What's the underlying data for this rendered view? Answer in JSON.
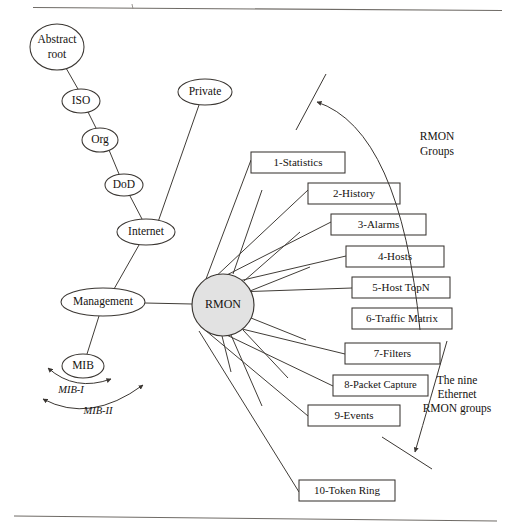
{
  "figure": {
    "top_rule": true,
    "bottom_rule": true
  },
  "tree": {
    "nodes": [
      {
        "id": "abstract-root",
        "label": "Abstract\nroot",
        "line1": "Abstract",
        "line2": "root",
        "cx": 57,
        "cy": 47,
        "rx": 27,
        "ry": 23,
        "font_size": 11.5
      },
      {
        "id": "iso",
        "label": "ISO",
        "cx": 81,
        "cy": 101,
        "rx": 19,
        "ry": 12,
        "font_size": 11.5
      },
      {
        "id": "org",
        "label": "Org",
        "cx": 100,
        "cy": 140,
        "rx": 18,
        "ry": 12,
        "font_size": 11.5
      },
      {
        "id": "dod",
        "label": "DoD",
        "cx": 124,
        "cy": 185,
        "rx": 19,
        "ry": 11,
        "font_size": 11.5
      },
      {
        "id": "internet",
        "label": "Internet",
        "cx": 146,
        "cy": 232,
        "rx": 29,
        "ry": 13,
        "font_size": 11.5
      },
      {
        "id": "private",
        "label": "Private",
        "cx": 205,
        "cy": 92,
        "rx": 27,
        "ry": 13,
        "font_size": 11.5
      },
      {
        "id": "management",
        "label": "Management",
        "cx": 103,
        "cy": 302,
        "rx": 42,
        "ry": 14,
        "font_size": 11.5
      },
      {
        "id": "mib",
        "label": "MIB",
        "cx": 83,
        "cy": 366,
        "rx": 21,
        "ry": 12,
        "font_size": 11.5
      }
    ],
    "edges": [
      {
        "from": "abstract-root",
        "to": "iso"
      },
      {
        "from": "iso",
        "to": "org"
      },
      {
        "from": "org",
        "to": "dod"
      },
      {
        "from": "dod",
        "to": "internet"
      },
      {
        "from": "private",
        "to": "internet"
      },
      {
        "from": "internet",
        "to": "management"
      },
      {
        "from": "management",
        "to": "mib"
      },
      {
        "from": "management",
        "to": "rmon"
      }
    ]
  },
  "rmon": {
    "label": "RMON",
    "cx": 223,
    "cy": 305,
    "r": 31,
    "fill": "#e2e2e2",
    "font_size": 12
  },
  "groups": {
    "boxes": [
      {
        "id": "g1",
        "label": "1-Statistics",
        "x": 251,
        "y": 152,
        "w": 94,
        "h": 21
      },
      {
        "id": "g2",
        "label": "2-History",
        "x": 308,
        "y": 183,
        "w": 92,
        "h": 21
      },
      {
        "id": "g3",
        "label": "3-Alarms",
        "x": 331,
        "y": 214,
        "w": 95,
        "h": 21
      },
      {
        "id": "g4",
        "label": "4-Hosts",
        "x": 346,
        "y": 246,
        "w": 98,
        "h": 21
      },
      {
        "id": "g5",
        "label": "5-Host TopN",
        "x": 352,
        "y": 277,
        "w": 98,
        "h": 21
      },
      {
        "id": "g6",
        "label": "6-Traffic Matrix",
        "x": 352,
        "y": 308,
        "w": 100,
        "h": 21
      },
      {
        "id": "g7",
        "label": "7-Filters",
        "x": 345,
        "y": 343,
        "w": 95,
        "h": 21
      },
      {
        "id": "g8",
        "label": "8-Packet Capture",
        "x": 333,
        "y": 375,
        "w": 95,
        "h": 21
      },
      {
        "id": "g9",
        "label": "9-Events",
        "x": 308,
        "y": 405,
        "w": 92,
        "h": 21
      },
      {
        "id": "g10",
        "label": "10-Token Ring",
        "x": 299,
        "y": 480,
        "w": 96,
        "h": 21
      }
    ],
    "box_font_size": 11
  },
  "annotations": {
    "rmon_groups": {
      "line1": "RMON",
      "line2": "Groups",
      "x": 437,
      "y": 142,
      "font_size": 11.5
    },
    "nine_ethernet": {
      "line1": "The nine",
      "line2": "Ethernet",
      "line3": "RMON groups",
      "x": 457,
      "y": 394,
      "font_size": 11.5
    },
    "mib_i": {
      "label": "MIB-I",
      "x": 71,
      "y": 391,
      "font_size": 10.5
    },
    "mib_ii": {
      "label": "MIB-II",
      "x": 98,
      "y": 412,
      "font_size": 10.5
    }
  }
}
